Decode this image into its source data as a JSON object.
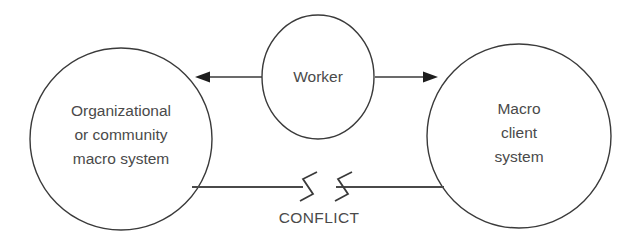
{
  "diagram": {
    "type": "conceptual-relationship-diagram",
    "background_color": "#ffffff",
    "stroke_color": "#3a3a3a",
    "text_color": "#4a4a4a",
    "nodes": [
      {
        "id": "left-macro-system",
        "shape": "circle",
        "label_lines": [
          "Organizational",
          "or community",
          "macro system"
        ]
      },
      {
        "id": "worker",
        "shape": "ellipse",
        "label_lines": [
          "Worker"
        ]
      },
      {
        "id": "right-macro-client",
        "shape": "circle",
        "label_lines": [
          "Macro",
          "client",
          "system"
        ]
      }
    ],
    "connectors": [
      {
        "id": "worker-to-left-arrow",
        "from": "worker",
        "to": "left-macro-system",
        "style": "solid-line-single-arrow",
        "direction": "left"
      },
      {
        "id": "worker-to-right-arrow",
        "from": "worker",
        "to": "right-macro-client",
        "style": "solid-line-single-arrow",
        "direction": "right"
      },
      {
        "id": "conflict-connector",
        "from": "left-macro-system",
        "to": "right-macro-client",
        "style": "line-with-break-symbols",
        "direction": "none",
        "label": "CONFLICT"
      }
    ],
    "labels": {
      "left_line_1": "Organizational",
      "left_line_2": "or community",
      "left_line_3": "macro system",
      "center_line_1": "Worker",
      "right_line_1": "Macro",
      "right_line_2": "client",
      "right_line_3": "system",
      "conflict": "CONFLICT"
    }
  }
}
